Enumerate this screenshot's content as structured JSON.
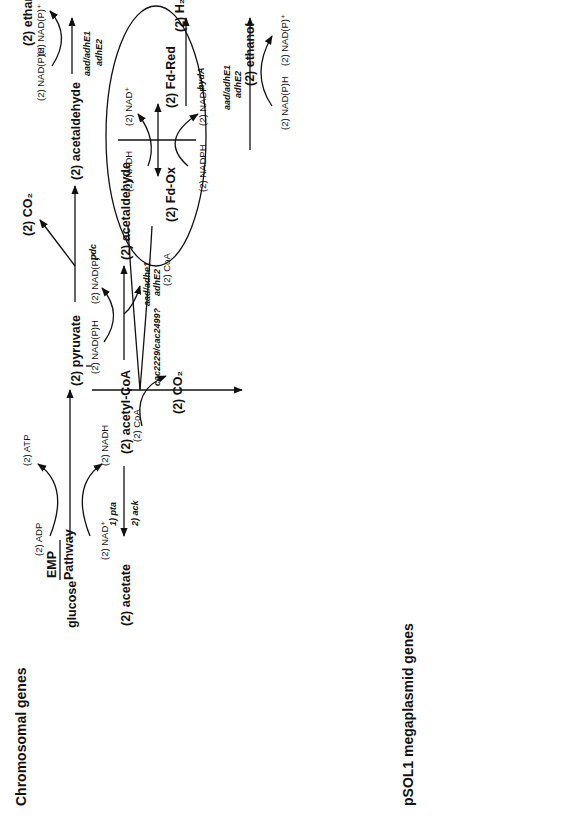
{
  "figure": {
    "orientation": "rotated-90-ccw",
    "metabolites": {
      "glucose": "glucose",
      "emp": "EMP",
      "pathway": "Pathway",
      "pyruvate": "(2) pyruvate",
      "acetyl_coa": "(2) acetyl-CoA",
      "acetate": "(2) acetate",
      "acetaldehyde_top": "(2) acetaldehyde",
      "ethanol_top": "(2) ethanol",
      "acetaldehyde_mid": "(2) acetaldehyde",
      "ethanol_mid": "(2) ethanol",
      "co2_pdc": "(2) CO₂",
      "co2_pfor": "(2) CO₂",
      "fd_ox": "(2) Fd-Ox",
      "fd_red": "(2) Fd-Red",
      "h2": "(2) H₂",
      "acetoacetyl_coa": "acetoacetyl-CoA",
      "hydroxybutyryl_coa": "β-hydroxybutyryl-CoA",
      "h2o": "H₂O",
      "crotonyl_coa": "crotonyl-CoA",
      "butyryl_coa": "butyryl-CoA",
      "butyrate": "butyrate",
      "butyraldehyde": "butyraldehyde",
      "butanol": "butanol",
      "acetoacetate": "acetoacetate",
      "acetone": "acetone",
      "co2_adc": "CO₂"
    },
    "cofactors": {
      "adp": "(2) ADP",
      "atp": "(2) ATP",
      "nad_plus_emp": "(2) NAD⁺",
      "nadh_emp": "(2) NADH",
      "coa_pfor": "(2) CoA",
      "nadph_top_in": "(2) NAD(P)H",
      "nadp_top_out": "(2) NAD(P)⁺",
      "nadh_fd": "(2) NADH",
      "nad_plus_fd": "(2) NAD⁺",
      "nadph_fd": "(2) NADPH",
      "nadp_plus_fd": "(2) NADP⁺",
      "nadph_acald_in": "(2) NAD(P)H",
      "nadp_acald_out": "(2) NAD(P)⁺",
      "coa_acald": "(2) CoA",
      "nadph_eth2_in": "(2) NAD(P)H",
      "nadp_eth2_out": "(2) NAD(P)⁺",
      "coa_thl": "CoA",
      "nadh_hbd": "NADH",
      "nad_plus_hbd": "NAD⁺",
      "nadh_bcd": "NADH",
      "nad_plus_bcd": "NAD⁺",
      "nadph_bcd": "NAD(P)H",
      "nadph_butald_in": "NAD(P)H",
      "nadp_butald_out": "NAD(P)⁺",
      "coa_butald": "CoA",
      "nadph_but_in": "NAD(P)H",
      "nadp_but_out": "NAD(P)⁺"
    },
    "enzymes": {
      "pdc": "pdc",
      "pfor": "cac2229/cac2499?",
      "hyda": "hydA",
      "adh_top_1": "aad/adhE1",
      "adh_top_2": "adhE2",
      "adh_acald_1": "aad/adhe1",
      "adh_acald_2": "adhE2",
      "adh_eth2_1": "aad/adhE1",
      "adh_eth2_2": "adhE2",
      "pta": "1) pta",
      "ack": "2) ack",
      "thl_1": "thl",
      "thl_2": "thil",
      "ctfab_1": "ctfA/B",
      "ctfab_2": "ctfA/B",
      "hbd": "hbd",
      "crt": "crt",
      "bcd": "bcd",
      "ptb": "1) ptb",
      "buk": "2) buk",
      "adh_butald_1": "aad/adhE1",
      "adh_butald_2": "adhE2",
      "bdh_1": "bdhA/B",
      "bdh_2": "aad/adhE1",
      "bdh_3": "adhE2",
      "adc": "adc"
    }
  },
  "chromosomal_table": {
    "title": "Chromosomal genes",
    "highlight_color": "#c8c8c8",
    "rows": [
      {
        "gene": "hydA",
        "locus": "CAC0028",
        "shaded": false
      },
      {
        "gene": "ldh1",
        "locus": "CAC0267",
        "shaded": true
      },
      {
        "gene": "ldh2",
        "locus": "CAC1543",
        "shaded": false
      },
      {
        "gene": "buk2",
        "locus": "CAC1660",
        "shaded": true
      },
      {
        "gene": "pta",
        "locus": "CAC1742",
        "shaded": false
      },
      {
        "gene": "ack/askA",
        "locus": "CAC1743",
        "shaded": false
      },
      {
        "gene": "ldh3",
        "locus": "CAC2691",
        "shaded": true
      },
      {
        "gene": "hbd",
        "locus": "CAC2708",
        "shaded": false
      },
      {
        "gene": "etfA",
        "locus": "CAC2709",
        "shaded": false
      },
      {
        "gene": "etfB",
        "locus": "CAC2710",
        "shaded": false
      },
      {
        "gene": "bcd",
        "locus": "CAC2711",
        "shaded": false
      },
      {
        "gene": "crt",
        "locus": "CAC2712",
        "shaded": false
      },
      {
        "gene": "thl",
        "locus": "CAC2873",
        "shaded": true
      },
      {
        "gene": "buk",
        "locus": "CAC3075",
        "shaded": false
      },
      {
        "gene": "ptb",
        "locus": "CAC3076",
        "shaded": false
      },
      {
        "gene": "bdhB",
        "locus": "CAC3298",
        "shaded": true
      },
      {
        "gene": "bdhA",
        "locus": "CAC3299",
        "shaded": false
      },
      {
        "gene": "ldh4",
        "locus": "CAC3552",
        "shaded": true
      }
    ]
  },
  "megaplasmid_table": {
    "title": "pSOL1 megaplasmid genes",
    "rows": [
      {
        "gene": "pdc",
        "locus": "CAP0025",
        "shaded": false
      },
      {
        "gene": "adhE/adhE2",
        "locus": "CAP0035",
        "shaded": true
      },
      {
        "gene": "thil",
        "locus": "CAP0078",
        "shaded": false
      },
      {
        "gene": "aad/adhE1",
        "locus": "CAP0162",
        "shaded": true
      },
      {
        "gene": "ctfA",
        "locus": "CAP0163",
        "shaded": true
      },
      {
        "gene": "ctfB",
        "locus": "CAP0164",
        "shaded": true
      },
      {
        "gene": "adc",
        "locus": "CAP0165",
        "shaded": false
      }
    ]
  }
}
